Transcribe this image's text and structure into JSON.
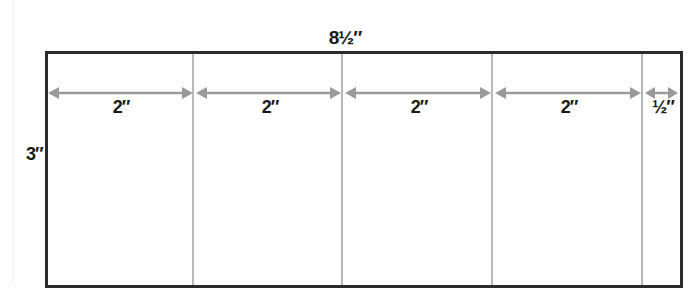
{
  "diagram": {
    "overall_width_label": "8½″",
    "height_label": "3″",
    "segments": [
      {
        "label": "2″",
        "x1": 48,
        "x2": 192
      },
      {
        "label": "2″",
        "x1": 196,
        "x2": 341
      },
      {
        "label": "2″",
        "x1": 345,
        "x2": 491
      },
      {
        "label": "2″",
        "x1": 495,
        "x2": 641
      },
      {
        "label": "½″",
        "x1": 645,
        "x2": 678
      }
    ],
    "dividers_x": [
      193,
      342,
      492,
      642
    ],
    "colors": {
      "border": "#2b2b2b",
      "divider": "#b8b8b8",
      "arrow": "#9a9a9a",
      "text": "#1a1a1a"
    }
  }
}
